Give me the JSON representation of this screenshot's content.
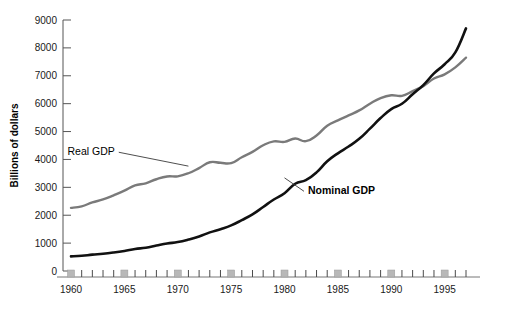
{
  "chart_data": {
    "type": "line",
    "title": "",
    "xlabel": "",
    "ylabel": "Billions of dollars",
    "xlim": [
      1959,
      1998
    ],
    "ylim": [
      0,
      9000
    ],
    "grid": false,
    "legend_position": "inline-annotations",
    "y_ticks": [
      0,
      1000,
      2000,
      3000,
      4000,
      5000,
      6000,
      7000,
      8000,
      9000
    ],
    "y_tick_labels": [
      "0",
      "1000",
      "2000",
      "3000",
      "4000",
      "5000",
      "6000",
      "7000",
      "8000",
      "9000"
    ],
    "x_ticks": [
      1960,
      1961,
      1962,
      1963,
      1964,
      1965,
      1966,
      1967,
      1968,
      1969,
      1970,
      1971,
      1972,
      1973,
      1974,
      1975,
      1976,
      1977,
      1978,
      1979,
      1980,
      1981,
      1982,
      1983,
      1984,
      1985,
      1986,
      1987,
      1988,
      1989,
      1990,
      1991,
      1992,
      1993,
      1994,
      1995,
      1996,
      1997
    ],
    "x_tick_labels": [
      "1960",
      "1965",
      "1970",
      "1975",
      "1980",
      "1985",
      "1990",
      "1995"
    ],
    "x_labeled_years": [
      1960,
      1965,
      1970,
      1975,
      1980,
      1985,
      1990,
      1995
    ],
    "x": [
      1960,
      1961,
      1962,
      1963,
      1964,
      1965,
      1966,
      1967,
      1968,
      1969,
      1970,
      1971,
      1972,
      1973,
      1974,
      1975,
      1976,
      1977,
      1978,
      1979,
      1980,
      1981,
      1982,
      1983,
      1984,
      1985,
      1986,
      1987,
      1988,
      1989,
      1990,
      1991,
      1992,
      1993,
      1994,
      1995,
      1996,
      1997
    ],
    "series": [
      {
        "name": "Real GDP",
        "color": "#7a7a7a",
        "width": 2.4,
        "label_x": 1964.1,
        "label_y": 4150,
        "leader_to_x": 1971.0,
        "leader_to_y": 3760,
        "bold": false,
        "values": [
          2263,
          2320,
          2460,
          2565,
          2715,
          2880,
          3070,
          3145,
          3290,
          3390,
          3395,
          3505,
          3690,
          3900,
          3880,
          3870,
          4080,
          4270,
          4510,
          4650,
          4630,
          4750,
          4655,
          4860,
          5210,
          5400,
          5580,
          5760,
          6000,
          6200,
          6300,
          6280,
          6450,
          6630,
          6900,
          7050,
          7300,
          7650
        ]
      },
      {
        "name": "Nominal GDP",
        "color": "#111111",
        "width": 2.6,
        "label_x": 1982.2,
        "label_y": 2750,
        "leader_to_x": 1980.0,
        "leader_to_y": 3340,
        "bold": true,
        "values": [
          526,
          545,
          586,
          618,
          664,
          720,
          790,
          834,
          911,
          985,
          1039,
          1128,
          1240,
          1385,
          1501,
          1635,
          1824,
          2031,
          2295,
          2563,
          2790,
          3128,
          3255,
          3536,
          3933,
          4220,
          4463,
          4739,
          5104,
          5484,
          5803,
          5996,
          6338,
          6667,
          7085,
          7415,
          7839,
          8700
        ]
      }
    ],
    "recession_markers": [
      1960,
      1965,
      1970,
      1975,
      1980,
      1985,
      1990,
      1995
    ]
  }
}
